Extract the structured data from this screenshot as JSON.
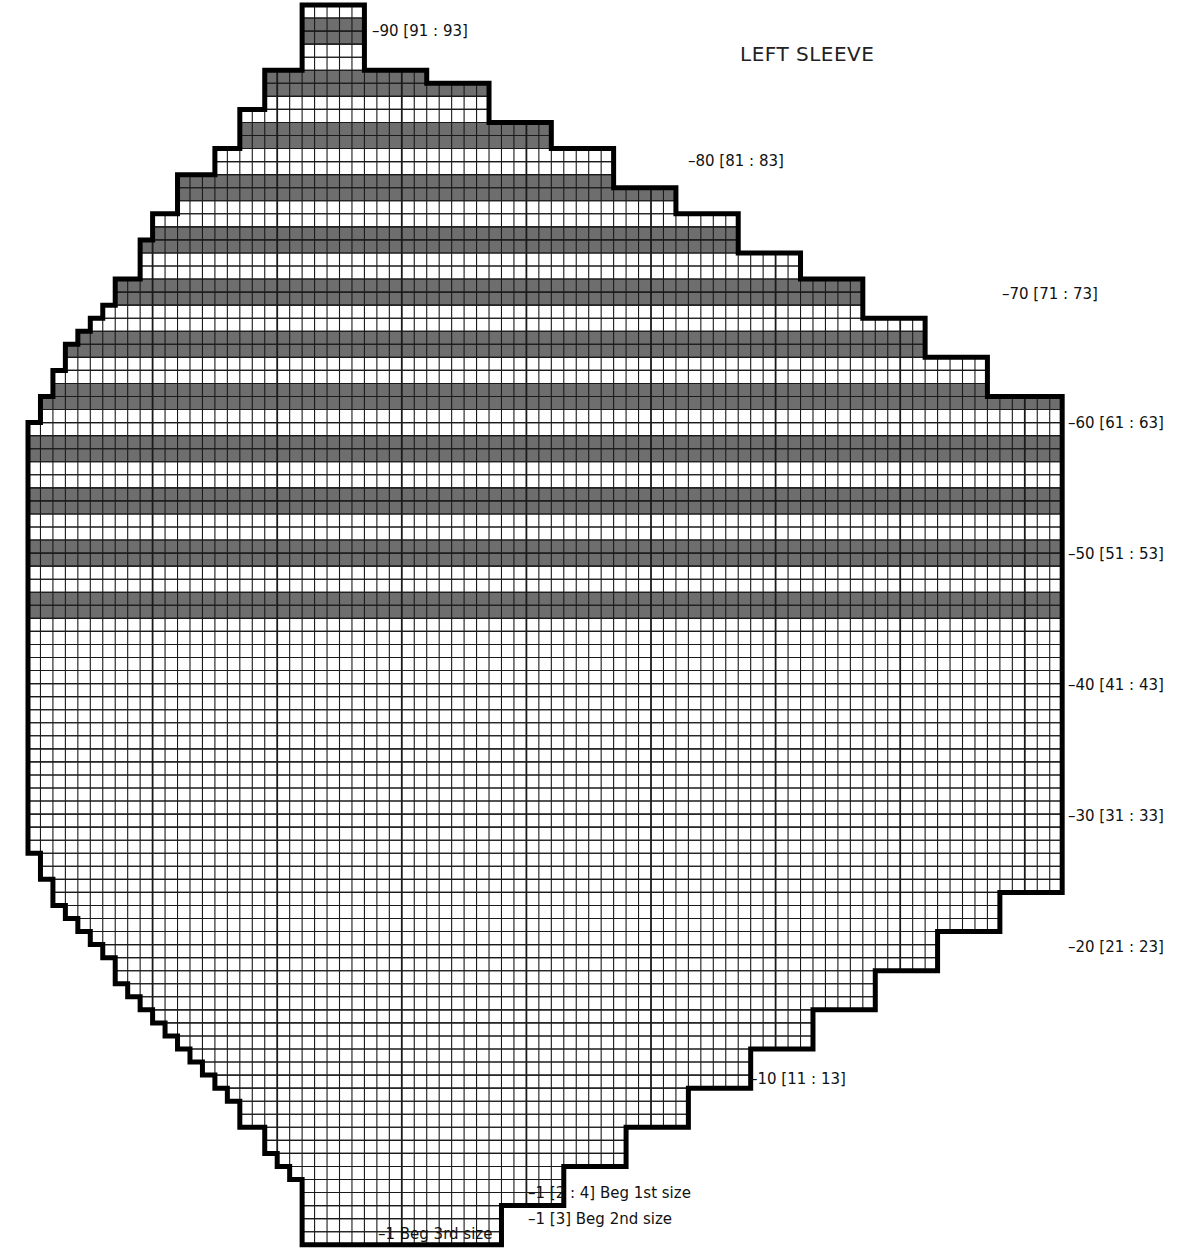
{
  "title": "LEFT SLEEVE",
  "grid": {
    "x0": 28,
    "y0": 5,
    "cols": 83,
    "rows": 95,
    "cell_w": 12.46,
    "cell_h": 13.05,
    "stripe_color": "#6e6e6e",
    "line_color": "#1a1a1a",
    "outline_color": "#000000"
  },
  "shape_rows_top_to_bottom": [
    [
      22,
      27
    ],
    [
      22,
      27
    ],
    [
      22,
      27
    ],
    [
      22,
      27
    ],
    [
      22,
      27
    ],
    [
      19,
      32
    ],
    [
      19,
      37
    ],
    [
      19,
      37
    ],
    [
      17,
      37
    ],
    [
      17,
      42
    ],
    [
      17,
      42
    ],
    [
      15,
      47
    ],
    [
      15,
      47
    ],
    [
      12,
      47
    ],
    [
      12,
      52
    ],
    [
      12,
      52
    ],
    [
      10,
      57
    ],
    [
      10,
      57
    ],
    [
      9,
      57
    ],
    [
      9,
      62
    ],
    [
      9,
      62
    ],
    [
      7,
      67
    ],
    [
      7,
      67
    ],
    [
      6,
      67
    ],
    [
      5,
      72
    ],
    [
      4,
      72
    ],
    [
      3,
      72
    ],
    [
      3,
      77
    ],
    [
      2,
      77
    ],
    [
      2,
      77
    ],
    [
      1,
      83
    ],
    [
      1,
      83
    ],
    [
      0,
      83
    ],
    [
      0,
      83
    ],
    [
      0,
      83
    ],
    [
      0,
      83
    ],
    [
      0,
      83
    ],
    [
      0,
      83
    ],
    [
      0,
      83
    ],
    [
      0,
      83
    ],
    [
      0,
      83
    ],
    [
      0,
      83
    ],
    [
      0,
      83
    ],
    [
      0,
      83
    ],
    [
      0,
      83
    ],
    [
      0,
      83
    ],
    [
      0,
      83
    ],
    [
      0,
      83
    ],
    [
      0,
      83
    ],
    [
      0,
      83
    ],
    [
      0,
      83
    ],
    [
      0,
      83
    ],
    [
      0,
      83
    ],
    [
      0,
      83
    ],
    [
      0,
      83
    ],
    [
      0,
      83
    ],
    [
      0,
      83
    ],
    [
      0,
      83
    ],
    [
      0,
      83
    ],
    [
      0,
      83
    ],
    [
      0,
      83
    ],
    [
      0,
      83
    ],
    [
      0,
      83
    ],
    [
      0,
      83
    ],
    [
      0,
      83
    ],
    [
      1,
      83
    ],
    [
      1,
      83
    ],
    [
      2,
      83
    ],
    [
      2,
      78
    ],
    [
      3,
      78
    ],
    [
      4,
      78
    ],
    [
      5,
      73
    ],
    [
      6,
      73
    ],
    [
      7,
      73
    ],
    [
      7,
      68
    ],
    [
      8,
      68
    ],
    [
      9,
      68
    ],
    [
      10,
      63
    ],
    [
      11,
      63
    ],
    [
      12,
      63
    ],
    [
      13,
      58
    ],
    [
      14,
      58
    ],
    [
      15,
      58
    ],
    [
      16,
      53
    ],
    [
      17,
      53
    ],
    [
      17,
      53
    ],
    [
      19,
      48
    ],
    [
      19,
      48
    ],
    [
      20,
      48
    ],
    [
      21,
      43
    ],
    [
      22,
      43
    ],
    [
      22,
      43
    ],
    [
      22,
      38
    ],
    [
      22,
      38
    ],
    [
      22,
      38
    ]
  ],
  "shaded_rows_top_to_bottom": [
    1,
    2,
    5,
    6,
    9,
    10,
    13,
    14,
    17,
    18,
    21,
    22,
    25,
    26,
    29,
    30,
    33,
    34,
    37,
    38,
    41,
    42,
    45,
    46
  ],
  "row_labels": [
    {
      "text": "90 [91 : 93]",
      "x": 372,
      "y": 22
    },
    {
      "text": "80 [81 : 83]",
      "x": 688,
      "y": 152
    },
    {
      "text": "70 [71 : 73]",
      "x": 1002,
      "y": 285
    },
    {
      "text": "60 [61 : 63]",
      "x": 1068,
      "y": 414
    },
    {
      "text": "50 [51 : 53]",
      "x": 1068,
      "y": 545
    },
    {
      "text": "40 [41 : 43]",
      "x": 1068,
      "y": 676
    },
    {
      "text": "30 [31 : 33]",
      "x": 1068,
      "y": 807
    },
    {
      "text": "20 [21 : 23]",
      "x": 1068,
      "y": 938
    },
    {
      "text": "10 [11 : 13]",
      "x": 750,
      "y": 1070
    },
    {
      "text": "1 [2 : 4]  Beg 1st size",
      "x": 528,
      "y": 1184
    },
    {
      "text": "1 [3]  Beg 2nd size",
      "x": 528,
      "y": 1210
    },
    {
      "text": "1  Beg 3rd size",
      "x": 378,
      "y": 1225
    }
  ]
}
